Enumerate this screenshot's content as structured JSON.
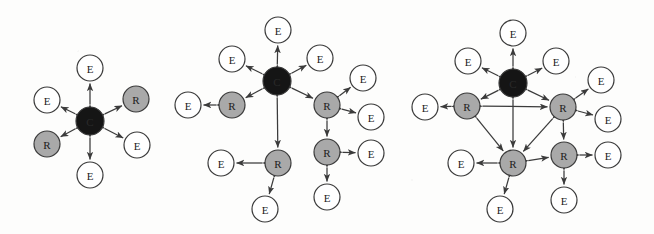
{
  "figure": {
    "background_color": "#fdfdfc",
    "node_colors": {
      "core": "#151515",
      "relay": "#a9a9a9",
      "edge_device": "#ffffff",
      "stroke": "#3a3a3a",
      "arrow": "#3b3b3b"
    },
    "legend_labels": {
      "core": "C",
      "relay": "R",
      "edge_device": "E"
    },
    "panels": [
      {
        "id": "panel-1",
        "name": "topology-small",
        "nodes": [
          {
            "id": "p1-c",
            "label": "C",
            "type": "core",
            "x": 90,
            "y": 121,
            "r": 14
          },
          {
            "id": "p1-e1",
            "label": "E",
            "type": "edge",
            "x": 90,
            "y": 68,
            "r": 13
          },
          {
            "id": "p1-e2",
            "label": "E",
            "type": "edge",
            "x": 47,
            "y": 100,
            "r": 13
          },
          {
            "id": "p1-r1",
            "label": "R",
            "type": "relay",
            "x": 136,
            "y": 99,
            "r": 13
          },
          {
            "id": "p1-r2",
            "label": "R",
            "type": "relay",
            "x": 47,
            "y": 144,
            "r": 13
          },
          {
            "id": "p1-e3",
            "label": "E",
            "type": "edge",
            "x": 137,
            "y": 145,
            "r": 13
          },
          {
            "id": "p1-e4",
            "label": "E",
            "type": "edge",
            "x": 90,
            "y": 175,
            "r": 13
          }
        ],
        "links": [
          {
            "from": "p1-c",
            "to": "p1-e1",
            "arrows": "both"
          },
          {
            "from": "p1-c",
            "to": "p1-e2",
            "arrows": "both"
          },
          {
            "from": "p1-c",
            "to": "p1-r1",
            "arrows": "both"
          },
          {
            "from": "p1-c",
            "to": "p1-r2",
            "arrows": "both"
          },
          {
            "from": "p1-c",
            "to": "p1-e3",
            "arrows": "both"
          },
          {
            "from": "p1-c",
            "to": "p1-e4",
            "arrows": "both"
          }
        ]
      },
      {
        "id": "panel-2",
        "name": "topology-medium",
        "nodes": [
          {
            "id": "p2-c",
            "label": "C",
            "type": "core",
            "x": 277,
            "y": 81,
            "r": 14
          },
          {
            "id": "p2-e1",
            "label": "E",
            "type": "edge",
            "x": 278,
            "y": 30,
            "r": 13
          },
          {
            "id": "p2-e2",
            "label": "E",
            "type": "edge",
            "x": 232,
            "y": 59,
            "r": 13
          },
          {
            "id": "p2-e3",
            "label": "E",
            "type": "edge",
            "x": 320,
            "y": 58,
            "r": 13
          },
          {
            "id": "p2-r1",
            "label": "R",
            "type": "relay",
            "x": 232,
            "y": 105,
            "r": 13
          },
          {
            "id": "p2-e4",
            "label": "E",
            "type": "edge",
            "x": 188,
            "y": 105,
            "r": 13
          },
          {
            "id": "p2-r2",
            "label": "R",
            "type": "relay",
            "x": 327,
            "y": 105,
            "r": 13
          },
          {
            "id": "p2-e5",
            "label": "E",
            "type": "edge",
            "x": 363,
            "y": 78,
            "r": 13
          },
          {
            "id": "p2-e6",
            "label": "E",
            "type": "edge",
            "x": 371,
            "y": 117,
            "r": 13
          },
          {
            "id": "p2-r3",
            "label": "R",
            "type": "relay",
            "x": 327,
            "y": 152,
            "r": 13
          },
          {
            "id": "p2-e7",
            "label": "E",
            "type": "edge",
            "x": 371,
            "y": 153,
            "r": 13
          },
          {
            "id": "p2-e8",
            "label": "E",
            "type": "edge",
            "x": 327,
            "y": 197,
            "r": 13
          },
          {
            "id": "p2-r4",
            "label": "R",
            "type": "relay",
            "x": 278,
            "y": 163,
            "r": 13
          },
          {
            "id": "p2-e9",
            "label": "E",
            "type": "edge",
            "x": 221,
            "y": 163,
            "r": 13
          },
          {
            "id": "p2-e10",
            "label": "E",
            "type": "edge",
            "x": 265,
            "y": 209,
            "r": 13
          }
        ],
        "links": [
          {
            "from": "p2-c",
            "to": "p2-e1",
            "arrows": "both"
          },
          {
            "from": "p2-c",
            "to": "p2-e2",
            "arrows": "both"
          },
          {
            "from": "p2-c",
            "to": "p2-e3",
            "arrows": "both"
          },
          {
            "from": "p2-c",
            "to": "p2-r1",
            "arrows": "both"
          },
          {
            "from": "p2-c",
            "to": "p2-r2",
            "arrows": "both"
          },
          {
            "from": "p2-c",
            "to": "p2-r4",
            "arrows": "both"
          },
          {
            "from": "p2-r1",
            "to": "p2-e4",
            "arrows": "both"
          },
          {
            "from": "p2-r2",
            "to": "p2-e5",
            "arrows": "both"
          },
          {
            "from": "p2-r2",
            "to": "p2-e6",
            "arrows": "both"
          },
          {
            "from": "p2-r2",
            "to": "p2-r3",
            "arrows": "both"
          },
          {
            "from": "p2-r3",
            "to": "p2-e7",
            "arrows": "both"
          },
          {
            "from": "p2-r3",
            "to": "p2-e8",
            "arrows": "both"
          },
          {
            "from": "p2-r4",
            "to": "p2-e9",
            "arrows": "both"
          },
          {
            "from": "p2-r4",
            "to": "p2-e10",
            "arrows": "both"
          }
        ]
      },
      {
        "id": "panel-3",
        "name": "topology-large",
        "nodes": [
          {
            "id": "p3-c",
            "label": "C",
            "type": "core",
            "x": 513,
            "y": 83,
            "r": 14
          },
          {
            "id": "p3-e1",
            "label": "E",
            "type": "edge",
            "x": 513,
            "y": 33,
            "r": 13
          },
          {
            "id": "p3-e2",
            "label": "E",
            "type": "edge",
            "x": 468,
            "y": 61,
            "r": 13
          },
          {
            "id": "p3-e3",
            "label": "E",
            "type": "edge",
            "x": 556,
            "y": 61,
            "r": 13
          },
          {
            "id": "p3-r1",
            "label": "R",
            "type": "relay",
            "x": 467,
            "y": 106,
            "r": 13
          },
          {
            "id": "p3-e4",
            "label": "E",
            "type": "edge",
            "x": 425,
            "y": 107,
            "r": 13
          },
          {
            "id": "p3-r2",
            "label": "R",
            "type": "relay",
            "x": 563,
            "y": 107,
            "r": 13
          },
          {
            "id": "p3-e5",
            "label": "E",
            "type": "edge",
            "x": 601,
            "y": 80,
            "r": 13
          },
          {
            "id": "p3-e6",
            "label": "E",
            "type": "edge",
            "x": 608,
            "y": 119,
            "r": 13
          },
          {
            "id": "p3-r3",
            "label": "R",
            "type": "relay",
            "x": 513,
            "y": 163,
            "r": 13
          },
          {
            "id": "p3-e7",
            "label": "E",
            "type": "edge",
            "x": 461,
            "y": 163,
            "r": 13
          },
          {
            "id": "p3-e8",
            "label": "E",
            "type": "edge",
            "x": 500,
            "y": 209,
            "r": 13
          },
          {
            "id": "p3-r4",
            "label": "R",
            "type": "relay",
            "x": 564,
            "y": 155,
            "r": 13
          },
          {
            "id": "p3-e9",
            "label": "E",
            "type": "edge",
            "x": 608,
            "y": 155,
            "r": 13
          },
          {
            "id": "p3-e10",
            "label": "E",
            "type": "edge",
            "x": 564,
            "y": 200,
            "r": 13
          }
        ],
        "links": [
          {
            "from": "p3-c",
            "to": "p3-e1",
            "arrows": "both"
          },
          {
            "from": "p3-c",
            "to": "p3-e2",
            "arrows": "both"
          },
          {
            "from": "p3-c",
            "to": "p3-e3",
            "arrows": "both"
          },
          {
            "from": "p3-c",
            "to": "p3-r1",
            "arrows": "both"
          },
          {
            "from": "p3-c",
            "to": "p3-r2",
            "arrows": "both"
          },
          {
            "from": "p3-c",
            "to": "p3-r3",
            "arrows": "both"
          },
          {
            "from": "p3-r1",
            "to": "p3-e4",
            "arrows": "both"
          },
          {
            "from": "p3-r1",
            "to": "p3-r2",
            "arrows": "both"
          },
          {
            "from": "p3-r1",
            "to": "p3-r3",
            "arrows": "both"
          },
          {
            "from": "p3-r2",
            "to": "p3-e5",
            "arrows": "both"
          },
          {
            "from": "p3-r2",
            "to": "p3-e6",
            "arrows": "both"
          },
          {
            "from": "p3-r2",
            "to": "p3-r3",
            "arrows": "both"
          },
          {
            "from": "p3-r2",
            "to": "p3-r4",
            "arrows": "both"
          },
          {
            "from": "p3-r3",
            "to": "p3-e7",
            "arrows": "both"
          },
          {
            "from": "p3-r3",
            "to": "p3-e8",
            "arrows": "both"
          },
          {
            "from": "p3-r3",
            "to": "p3-r4",
            "arrows": "both"
          },
          {
            "from": "p3-r4",
            "to": "p3-e9",
            "arrows": "both"
          },
          {
            "from": "p3-r4",
            "to": "p3-e10",
            "arrows": "both"
          }
        ]
      }
    ]
  }
}
